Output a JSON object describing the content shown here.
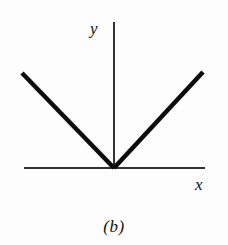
{
  "figure": {
    "caption": "(b)",
    "background_color": "#fdfdfd",
    "ink_color": "#111111"
  },
  "axes": {
    "x_label": "x",
    "y_label": "y",
    "axis_color": "#333333",
    "axis_line_width": 2,
    "x_axis": {
      "x1": 24,
      "y1": 168,
      "x2": 205,
      "y2": 168
    },
    "y_axis": {
      "x1": 114,
      "y1": 22,
      "x2": 114,
      "y2": 168
    }
  },
  "chart_data": {
    "type": "line",
    "title": "(b)",
    "xlabel": "x",
    "ylabel": "y",
    "grid": false,
    "legend": null,
    "series": [
      {
        "name": "left-branch",
        "points": [
          [
            22,
            73
          ],
          [
            114,
            168
          ]
        ],
        "color": "#0d0d0d",
        "line_width": 4.5
      },
      {
        "name": "right-branch",
        "points": [
          [
            114,
            168
          ],
          [
            203,
            72
          ]
        ],
        "color": "#0d0d0d",
        "line_width": 4.5
      }
    ],
    "vertex": [
      114,
      168
    ]
  }
}
